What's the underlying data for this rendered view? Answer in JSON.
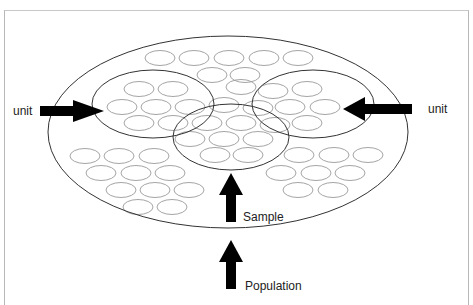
{
  "diagram": {
    "labels": {
      "unit_left": "unit",
      "unit_right": "unit",
      "sample": "Sample",
      "population": "Population"
    },
    "colors": {
      "outline": "#333333",
      "small_ellipse": "#9a9a9a",
      "arrow": "#000000",
      "frame": "#bbbbbb"
    },
    "population_ellipse": {
      "cx": 228,
      "cy": 132,
      "rx": 180,
      "ry": 96
    },
    "unit_circles": [
      {
        "name": "left-unit",
        "cx": 153,
        "cy": 104,
        "rx": 61,
        "ry": 34
      },
      {
        "name": "right-unit",
        "cx": 313,
        "cy": 104,
        "rx": 61,
        "ry": 34
      },
      {
        "name": "sample-unit",
        "cx": 231,
        "cy": 137,
        "rx": 58,
        "ry": 33
      }
    ],
    "small_ellipse_size": {
      "rx": 15,
      "ry": 7.5
    },
    "small_ellipses": [
      [
        160,
        58
      ],
      [
        194,
        58
      ],
      [
        229,
        58
      ],
      [
        264,
        58
      ],
      [
        298,
        58
      ],
      [
        212,
        75
      ],
      [
        245,
        75
      ],
      [
        139,
        89
      ],
      [
        173,
        89
      ],
      [
        241,
        87
      ],
      [
        273,
        91
      ],
      [
        307,
        89
      ],
      [
        122,
        107
      ],
      [
        156,
        107
      ],
      [
        190,
        107
      ],
      [
        224,
        105
      ],
      [
        258,
        108
      ],
      [
        290,
        107
      ],
      [
        325,
        107
      ],
      [
        139,
        123
      ],
      [
        173,
        123
      ],
      [
        207,
        123
      ],
      [
        241,
        123
      ],
      [
        275,
        125
      ],
      [
        307,
        123
      ],
      [
        190,
        139
      ],
      [
        224,
        139
      ],
      [
        258,
        139
      ],
      [
        85,
        156
      ],
      [
        119,
        156
      ],
      [
        154,
        156
      ],
      [
        215,
        155
      ],
      [
        248,
        155
      ],
      [
        299,
        155
      ],
      [
        334,
        155
      ],
      [
        368,
        155
      ],
      [
        101,
        173
      ],
      [
        136,
        173
      ],
      [
        170,
        173
      ],
      [
        281,
        173
      ],
      [
        316,
        173
      ],
      [
        350,
        173
      ],
      [
        121,
        190
      ],
      [
        155,
        190
      ],
      [
        189,
        190
      ],
      [
        298,
        190
      ],
      [
        333,
        190
      ],
      [
        138,
        207
      ],
      [
        172,
        207
      ]
    ],
    "arrows": [
      {
        "name": "left-unit-arrow",
        "direction": "right"
      },
      {
        "name": "right-unit-arrow",
        "direction": "left"
      },
      {
        "name": "sample-arrow",
        "direction": "up"
      },
      {
        "name": "population-arrow",
        "direction": "up"
      }
    ]
  }
}
